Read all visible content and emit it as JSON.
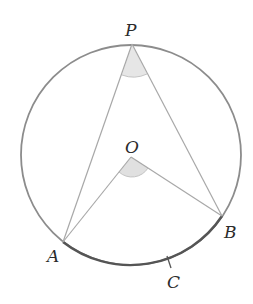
{
  "diagram": {
    "circle": {
      "cx": 131,
      "cy": 155,
      "r": 110,
      "stroke": "#8c8c8c"
    },
    "points": {
      "P": {
        "label": "P",
        "x": 132,
        "y": 44
      },
      "O": {
        "label": "O",
        "x": 131,
        "y": 157
      },
      "A": {
        "label": "A",
        "x": 63,
        "y": 242
      },
      "B": {
        "label": "B",
        "x": 222,
        "y": 216
      },
      "C": {
        "label": "C",
        "x": 169,
        "y": 262
      }
    },
    "segments": [
      "PA",
      "PB",
      "OA",
      "OB"
    ],
    "arc_highlight": {
      "from": "A",
      "to": "B",
      "via": "C",
      "color": "#555555"
    },
    "angle_marks": [
      {
        "vertex": "P",
        "fill": "#e6e6e6"
      },
      {
        "vertex": "O",
        "fill": "#e0e0e0"
      }
    ],
    "colors": {
      "line": "#a8a8a8",
      "circle": "#8c8c8c",
      "arc": "#555555",
      "shade": "#e4e4e4",
      "text": "#2b2b2b"
    }
  }
}
